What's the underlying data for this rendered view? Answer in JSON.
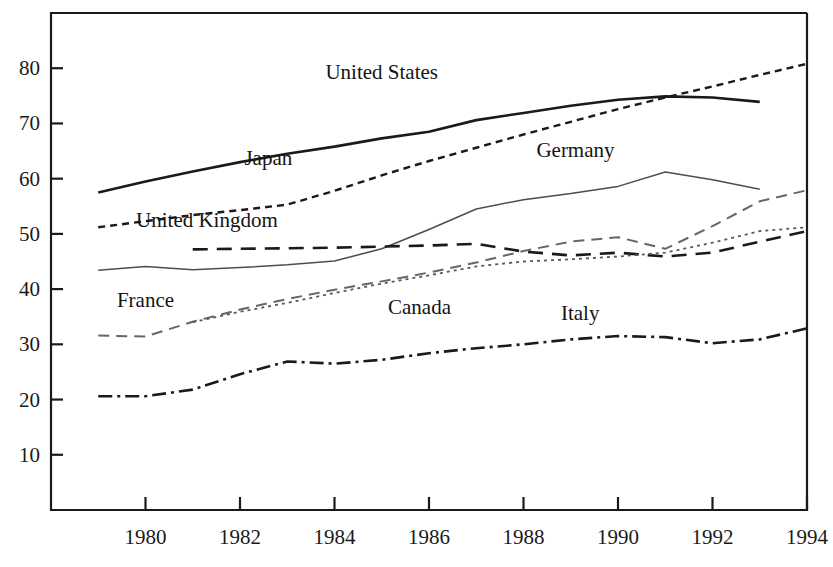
{
  "chart_data": {
    "type": "line",
    "title": "",
    "subtitle": "",
    "xlabel": "",
    "ylabel": "",
    "xlim": [
      1978,
      1994
    ],
    "ylim": [
      0,
      90
    ],
    "grid": false,
    "legend_position": "inline-labels",
    "x_ticks": [
      "1980",
      "1982",
      "1984",
      "1986",
      "1988",
      "1990",
      "1992",
      "1994"
    ],
    "x_tick_values": [
      1980,
      1982,
      1984,
      1986,
      1988,
      1990,
      1992,
      1994
    ],
    "y_ticks": [
      "10",
      "20",
      "30",
      "40",
      "50",
      "60",
      "70",
      "80"
    ],
    "y_tick_values": [
      10,
      20,
      30,
      40,
      50,
      60,
      70,
      80
    ],
    "series": [
      {
        "name": "United States",
        "style": "solid-bold",
        "color": "#1a1a1a",
        "width": 2.6,
        "dash": "",
        "label_x": 1985.0,
        "label_y": 78.0,
        "x": [
          1979,
          1980,
          1981,
          1982,
          1983,
          1984,
          1985,
          1986,
          1987,
          1988,
          1989,
          1990,
          1991,
          1992,
          1993
        ],
        "values": [
          57.5,
          59.5,
          61.3,
          63.0,
          64.5,
          65.8,
          67.3,
          68.5,
          70.6,
          71.9,
          73.2,
          74.3,
          74.9,
          74.7,
          73.9
        ]
      },
      {
        "name": "Japan",
        "style": "short-dash",
        "color": "#1a1a1a",
        "width": 2.4,
        "dash": "7,5",
        "label_x": 1982.6,
        "label_y": 62.5,
        "x": [
          1979,
          1980,
          1981,
          1982,
          1983,
          1984,
          1985,
          1986,
          1987,
          1988,
          1989,
          1990,
          1991,
          1992,
          1993,
          1994
        ],
        "values": [
          51.2,
          52.3,
          53.4,
          54.3,
          55.3,
          57.8,
          60.6,
          63.2,
          65.6,
          68.0,
          70.3,
          72.6,
          74.7,
          76.7,
          78.8,
          80.8
        ]
      },
      {
        "name": "Germany",
        "style": "thin-solid",
        "color": "#4d4d4d",
        "width": 1.5,
        "dash": "",
        "label_x": 1989.1,
        "label_y": 64.0,
        "x": [
          1979,
          1980,
          1981,
          1982,
          1983,
          1984,
          1985,
          1986,
          1987,
          1988,
          1989,
          1990,
          1991,
          1992,
          1993
        ],
        "values": [
          43.4,
          44.1,
          43.5,
          43.9,
          44.4,
          45.1,
          47.3,
          50.8,
          54.5,
          56.2,
          57.3,
          58.6,
          61.2,
          59.8,
          58.1
        ]
      },
      {
        "name": "United Kingdom",
        "style": "long-dash",
        "color": "#1a1a1a",
        "width": 2.6,
        "dash": "15,9",
        "label_x": 1981.3,
        "label_y": 51.3,
        "x": [
          1981,
          1982,
          1983,
          1984,
          1985,
          1986,
          1987,
          1988,
          1989,
          1990,
          1991,
          1992,
          1993,
          1994
        ],
        "values": [
          47.2,
          47.3,
          47.4,
          47.5,
          47.7,
          47.9,
          48.2,
          46.8,
          46.1,
          46.6,
          45.9,
          46.6,
          48.6,
          50.5
        ]
      },
      {
        "name": "France",
        "style": "medium-dash",
        "color": "#666666",
        "width": 2.0,
        "dash": "11,7",
        "label_x": 1980.0,
        "label_y": 36.8,
        "x": [
          1979,
          1980,
          1981,
          1982,
          1983,
          1984,
          1985,
          1986,
          1987,
          1988,
          1989,
          1990,
          1991,
          1992,
          1993,
          1994
        ],
        "values": [
          31.6,
          31.4,
          34.1,
          36.3,
          38.2,
          39.9,
          41.4,
          43.0,
          44.8,
          46.9,
          48.6,
          49.4,
          47.3,
          51.4,
          55.9,
          57.9
        ]
      },
      {
        "name": "Canada",
        "style": "dotted",
        "color": "#595959",
        "width": 1.8,
        "dash": "3,4",
        "label_x": 1985.8,
        "label_y": 35.5,
        "x": [
          1981,
          1982,
          1983,
          1984,
          1985,
          1986,
          1987,
          1988,
          1989,
          1990,
          1991,
          1992,
          1993,
          1994
        ],
        "values": [
          34.0,
          35.9,
          37.5,
          39.3,
          41.0,
          42.5,
          44.1,
          45.0,
          45.4,
          45.9,
          46.6,
          48.4,
          50.5,
          51.2
        ]
      },
      {
        "name": "Italy",
        "style": "dash-dot",
        "color": "#1a1a1a",
        "width": 2.6,
        "dash": "14,5,3,5",
        "label_x": 1989.2,
        "label_y": 34.4,
        "x": [
          1979,
          1980,
          1981,
          1982,
          1983,
          1984,
          1985,
          1986,
          1987,
          1988,
          1989,
          1990,
          1991,
          1992,
          1993,
          1994
        ],
        "values": [
          20.6,
          20.6,
          21.8,
          24.6,
          26.9,
          26.5,
          27.2,
          28.4,
          29.3,
          30.0,
          30.9,
          31.5,
          31.3,
          30.2,
          30.9,
          32.9
        ]
      }
    ]
  }
}
